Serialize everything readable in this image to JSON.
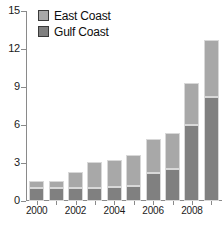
{
  "chart_data": {
    "type": "bar",
    "subtype": "stacked-vertical",
    "title": "",
    "xlabel": "",
    "ylabel": "",
    "categories": [
      "2000",
      "2001",
      "2002",
      "2003",
      "2004",
      "2005",
      "2006",
      "2007",
      "2008",
      "2009"
    ],
    "series": [
      {
        "name": "Gulf Coast",
        "color": "#808080",
        "values": [
          1.0,
          1.0,
          1.0,
          1.0,
          1.1,
          1.2,
          2.2,
          2.5,
          6.0,
          8.2
        ]
      },
      {
        "name": "East Coast",
        "color": "#a8a8a8",
        "values": [
          0.6,
          0.6,
          1.3,
          2.1,
          2.1,
          2.4,
          2.7,
          2.9,
          3.3,
          4.5
        ]
      }
    ],
    "totals": [
      1.6,
      1.6,
      2.3,
      3.1,
      3.2,
      3.6,
      4.9,
      5.4,
      9.3,
      12.7
    ],
    "ylim": [
      0,
      15
    ],
    "yticks": [
      0,
      3,
      6,
      9,
      12,
      15
    ],
    "ytick_labels": [
      "0",
      "3",
      "6",
      "9",
      "12",
      "15"
    ],
    "xtick_labels": [
      "2000",
      "2002",
      "2004",
      "2006",
      "2008"
    ],
    "xtick_categories": [
      "2000",
      "2002",
      "2004",
      "2006",
      "2008"
    ],
    "grid": false,
    "legend_position": "top-left",
    "legend_entries": [
      "East Coast",
      "Gulf Coast"
    ]
  },
  "legend": {
    "items": [
      {
        "label": "East Coast",
        "color": "#a8a8a8"
      },
      {
        "label": "Gulf Coast",
        "color": "#808080"
      }
    ]
  },
  "axes": {
    "y_labels": [
      "15",
      "12",
      "9",
      "6",
      "3",
      "0"
    ],
    "x_labels": [
      "2000",
      "2002",
      "2004",
      "2006",
      "2008"
    ]
  },
  "caption_fragment": ""
}
